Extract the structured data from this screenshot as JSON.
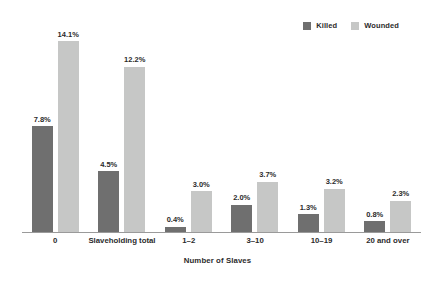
{
  "chart_data": {
    "type": "bar",
    "title": "",
    "xlabel": "Number of Slaves",
    "ylabel": "",
    "ylim": [
      0,
      15.3
    ],
    "grid": false,
    "legend_position": "top-right",
    "categories": [
      "0",
      "Slaveholding total",
      "1–2",
      "3–10",
      "10–19",
      "20 and over"
    ],
    "series": [
      {
        "name": "Killed",
        "color": "#6f6f6f",
        "values": [
          7.8,
          4.5,
          0.4,
          2.0,
          1.3,
          0.8
        ],
        "labels": [
          "7.8%",
          "4.5%",
          "0.4%",
          "2.0%",
          "1.3%",
          "0.8%"
        ]
      },
      {
        "name": "Wounded",
        "color": "#c6c7c6",
        "values": [
          14.1,
          12.2,
          3.0,
          3.7,
          3.2,
          2.3
        ],
        "labels": [
          "14.1%",
          "12.2%",
          "3.0%",
          "3.7%",
          "3.2%",
          "2.3%"
        ]
      }
    ]
  },
  "legend": {
    "items": [
      {
        "label": "Killed",
        "color": "#6f6f6f"
      },
      {
        "label": "Wounded",
        "color": "#c6c7c6"
      }
    ]
  },
  "axis": {
    "x_title": "Number of Slaves",
    "axis_color": "#9a9a9a"
  }
}
